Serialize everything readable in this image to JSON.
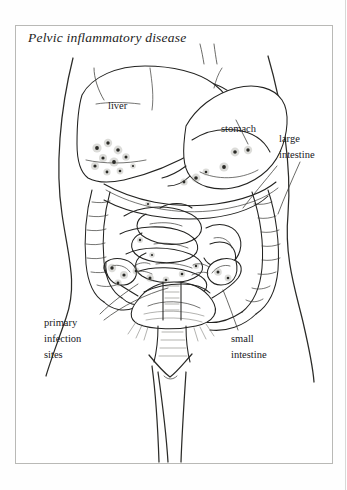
{
  "figure": {
    "title": "Pelvic inflammatory disease",
    "kind": "anatomical-line-illustration",
    "background_color": "#ffffff",
    "ink_color": "#1c1c1c",
    "frame_color": "#b9b9b6"
  },
  "labels": [
    {
      "id": "liver",
      "text": "liver",
      "lines": [
        "liver"
      ]
    },
    {
      "id": "stomach",
      "text": "stomach",
      "lines": [
        "stomach"
      ]
    },
    {
      "id": "large",
      "text": "large intestine",
      "lines": [
        "large",
        "intestine"
      ]
    },
    {
      "id": "small",
      "text": "small intestine",
      "lines": [
        "small",
        "intestine"
      ]
    },
    {
      "id": "primary",
      "text": "primary infection sites",
      "lines": [
        "primary",
        "infection",
        "sites"
      ]
    }
  ],
  "label_text": {
    "liver": "liver",
    "stomach": "stomach",
    "large_line1": "large",
    "large_line2": "intestine",
    "small_line1": "small",
    "small_line2": "intestine",
    "primary_line1": "primary",
    "primary_line2": "infection",
    "primary_line3": "sites"
  },
  "structures": [
    "body outline (torso, hips, thighs)",
    "liver",
    "stomach",
    "large intestine (colon frame)",
    "small intestine (coiled loops)",
    "uterus",
    "fallopian tubes",
    "ovaries",
    "vagina",
    "rectum"
  ],
  "markings": {
    "name": "infection sites",
    "appearance": "dark stippled spots",
    "regions": [
      "inferior liver margin",
      "beneath stomach",
      "pelvic organs",
      "fallopian tubes",
      "ovaries"
    ],
    "count_visible": 22
  }
}
